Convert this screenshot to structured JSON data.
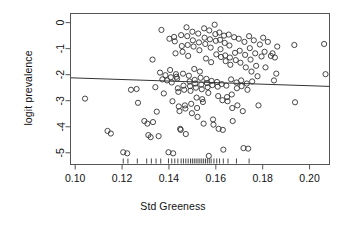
{
  "chart_data": {
    "type": "scatter",
    "title": "",
    "xlabel": "Std Greeness",
    "ylabel": "logit prevalence",
    "xlim": [
      0.098,
      0.2085
    ],
    "ylim": [
      -5.45,
      0.35
    ],
    "xticks": [
      0.1,
      0.12,
      0.14,
      0.16,
      0.18,
      0.2
    ],
    "xticklabels": [
      "0.10",
      "0.12",
      "0.14",
      "0.16",
      "0.18",
      "0.20"
    ],
    "yticks": [
      0,
      -1,
      -2,
      -3,
      -4,
      -5
    ],
    "yticklabels": [
      "0",
      "-1",
      "-2",
      "-3",
      "-4",
      "-5"
    ],
    "grid": false,
    "legend": null,
    "marker": {
      "shape": "open-circle",
      "radius_px": 2.6,
      "color": "#333333"
    },
    "regression_line": {
      "x": [
        0.098,
        0.2085
      ],
      "y": [
        -2.12,
        -2.45
      ],
      "color": "#333333",
      "width_px": 1
    },
    "rug": {
      "axis": "x",
      "values": [
        0.1205,
        0.1225,
        0.1265,
        0.1305,
        0.1325,
        0.1345,
        0.1365,
        0.1398,
        0.1412,
        0.1425,
        0.1438,
        0.1452,
        0.1462,
        0.1472,
        0.1482,
        0.1492,
        0.15,
        0.1508,
        0.1516,
        0.1524,
        0.1532,
        0.154,
        0.1548,
        0.1556,
        0.1564,
        0.1572,
        0.158,
        0.1592,
        0.1604,
        0.1616,
        0.1632,
        0.1652,
        0.1688,
        0.1742
      ]
    },
    "points": [
      [
        0.1042,
        -2.92
      ],
      [
        0.1138,
        -4.16
      ],
      [
        0.1152,
        -4.26
      ],
      [
        0.1205,
        -4.98
      ],
      [
        0.1222,
        -5.02
      ],
      [
        0.1238,
        -2.58
      ],
      [
        0.1262,
        -2.55
      ],
      [
        0.1268,
        -3.08
      ],
      [
        0.1295,
        -3.78
      ],
      [
        0.1308,
        -3.88
      ],
      [
        0.1312,
        -4.32
      ],
      [
        0.1322,
        -4.4
      ],
      [
        0.133,
        -1.42
      ],
      [
        0.1332,
        -3.82
      ],
      [
        0.1342,
        -2.48
      ],
      [
        0.1348,
        -3.42
      ],
      [
        0.1356,
        -4.36
      ],
      [
        0.1362,
        -1.92
      ],
      [
        0.1368,
        -0.28
      ],
      [
        0.1372,
        -2.18
      ],
      [
        0.1378,
        -2.72
      ],
      [
        0.1385,
        -2.02
      ],
      [
        0.1392,
        -2.22
      ],
      [
        0.1398,
        -4.98
      ],
      [
        0.1402,
        -0.62
      ],
      [
        0.1405,
        -1.82
      ],
      [
        0.1408,
        -2.1
      ],
      [
        0.1412,
        -2.3
      ],
      [
        0.1415,
        -3.02
      ],
      [
        0.1418,
        -5.02
      ],
      [
        0.1422,
        -0.55
      ],
      [
        0.1425,
        -0.72
      ],
      [
        0.1428,
        -1.18
      ],
      [
        0.143,
        -1.98
      ],
      [
        0.1432,
        -2.08
      ],
      [
        0.1435,
        -2.15
      ],
      [
        0.1438,
        -2.52
      ],
      [
        0.144,
        -2.66
      ],
      [
        0.1442,
        -3.22
      ],
      [
        0.1445,
        -3.4
      ],
      [
        0.1448,
        -4.08
      ],
      [
        0.145,
        -4.12
      ],
      [
        0.1452,
        -0.48
      ],
      [
        0.1455,
        -0.9
      ],
      [
        0.1458,
        -1.12
      ],
      [
        0.146,
        -1.96
      ],
      [
        0.1462,
        -2.42
      ],
      [
        0.1465,
        -2.58
      ],
      [
        0.1468,
        -3.18
      ],
      [
        0.147,
        -3.3
      ],
      [
        0.1472,
        -4.28
      ],
      [
        0.1475,
        -0.18
      ],
      [
        0.1478,
        -0.52
      ],
      [
        0.148,
        -0.86
      ],
      [
        0.1482,
        -1.28
      ],
      [
        0.1485,
        -2.04
      ],
      [
        0.1488,
        -2.26
      ],
      [
        0.149,
        -2.44
      ],
      [
        0.1492,
        -2.62
      ],
      [
        0.1495,
        -3.12
      ],
      [
        0.1498,
        -3.48
      ],
      [
        0.15,
        -0.35
      ],
      [
        0.1502,
        -0.68
      ],
      [
        0.1505,
        -0.92
      ],
      [
        0.1508,
        -1.78
      ],
      [
        0.151,
        -2.2
      ],
      [
        0.1512,
        -2.34
      ],
      [
        0.1515,
        -2.5
      ],
      [
        0.1518,
        -2.88
      ],
      [
        0.152,
        -3.28
      ],
      [
        0.1522,
        -3.62
      ],
      [
        0.1525,
        -0.42
      ],
      [
        0.1528,
        -0.76
      ],
      [
        0.153,
        -1.06
      ],
      [
        0.1532,
        -1.88
      ],
      [
        0.1535,
        -2.12
      ],
      [
        0.1538,
        -2.38
      ],
      [
        0.154,
        -2.56
      ],
      [
        0.1542,
        -2.94
      ],
      [
        0.1545,
        -3.05
      ],
      [
        0.1548,
        -3.88
      ],
      [
        0.155,
        -0.22
      ],
      [
        0.1552,
        -0.58
      ],
      [
        0.1555,
        -0.82
      ],
      [
        0.1558,
        -1.38
      ],
      [
        0.156,
        -2.16
      ],
      [
        0.1562,
        -2.32
      ],
      [
        0.1565,
        -2.48
      ],
      [
        0.1568,
        -2.7
      ],
      [
        0.157,
        -5.12
      ],
      [
        0.1572,
        -0.3
      ],
      [
        0.1575,
        -0.64
      ],
      [
        0.1578,
        -0.96
      ],
      [
        0.158,
        -1.52
      ],
      [
        0.1582,
        -2.24
      ],
      [
        0.1585,
        -2.4
      ],
      [
        0.1588,
        -3.72
      ],
      [
        0.159,
        -3.92
      ],
      [
        0.1595,
        -0.08
      ],
      [
        0.1598,
        -0.44
      ],
      [
        0.16,
        -0.7
      ],
      [
        0.1602,
        -1.22
      ],
      [
        0.1605,
        -2.28
      ],
      [
        0.1608,
        -2.46
      ],
      [
        0.161,
        -2.82
      ],
      [
        0.1612,
        -4.08
      ],
      [
        0.1615,
        -0.38
      ],
      [
        0.1618,
        -0.66
      ],
      [
        0.162,
        -1.02
      ],
      [
        0.1622,
        -1.32
      ],
      [
        0.1625,
        -2.36
      ],
      [
        0.1628,
        -2.98
      ],
      [
        0.163,
        -4.12
      ],
      [
        0.1632,
        -4.88
      ],
      [
        0.1635,
        -0.5
      ],
      [
        0.1638,
        -0.78
      ],
      [
        0.164,
        -1.26
      ],
      [
        0.1642,
        -1.48
      ],
      [
        0.1645,
        -2.42
      ],
      [
        0.1648,
        -2.86
      ],
      [
        0.165,
        -3.02
      ],
      [
        0.1655,
        -0.46
      ],
      [
        0.1658,
        -0.88
      ],
      [
        0.166,
        -1.34
      ],
      [
        0.1662,
        -1.62
      ],
      [
        0.1665,
        -2.18
      ],
      [
        0.1668,
        -2.76
      ],
      [
        0.167,
        -3.28
      ],
      [
        0.1672,
        -3.78
      ],
      [
        0.1678,
        -0.56
      ],
      [
        0.1682,
        -1.16
      ],
      [
        0.1685,
        -1.44
      ],
      [
        0.1688,
        -2.3
      ],
      [
        0.169,
        -2.52
      ],
      [
        0.1692,
        -3.18
      ],
      [
        0.1698,
        -0.62
      ],
      [
        0.1702,
        -1.08
      ],
      [
        0.1705,
        -1.54
      ],
      [
        0.1708,
        -2.22
      ],
      [
        0.171,
        -2.44
      ],
      [
        0.1715,
        -3.4
      ],
      [
        0.1718,
        -4.82
      ],
      [
        0.1722,
        -0.74
      ],
      [
        0.1725,
        -1.24
      ],
      [
        0.1728,
        -1.72
      ],
      [
        0.1732,
        -2.34
      ],
      [
        0.1735,
        -2.58
      ],
      [
        0.1738,
        -4.84
      ],
      [
        0.1742,
        -0.52
      ],
      [
        0.1745,
        -0.98
      ],
      [
        0.1748,
        -1.42
      ],
      [
        0.1752,
        -1.88
      ],
      [
        0.1755,
        -2.26
      ],
      [
        0.1762,
        -0.68
      ],
      [
        0.1768,
        -1.18
      ],
      [
        0.1772,
        -1.66
      ],
      [
        0.1778,
        -2.06
      ],
      [
        0.1782,
        -3.18
      ],
      [
        0.1788,
        -0.84
      ],
      [
        0.1795,
        -1.3
      ],
      [
        0.1802,
        -0.58
      ],
      [
        0.1808,
        -1.12
      ],
      [
        0.1812,
        -1.72
      ],
      [
        0.1822,
        -0.74
      ],
      [
        0.1835,
        -1.28
      ],
      [
        0.1842,
        -1.18
      ],
      [
        0.1848,
        -2.22
      ],
      [
        0.1852,
        -1.34
      ],
      [
        0.1858,
        -1.96
      ],
      [
        0.1862,
        -0.92
      ],
      [
        0.1935,
        -0.86
      ],
      [
        0.1938,
        -3.06
      ],
      [
        0.2062,
        -0.82
      ],
      [
        0.2068,
        -1.98
      ]
    ]
  },
  "figure": {
    "background": "#ffffff",
    "frame_color": "#555555",
    "text_color": "#111111"
  }
}
